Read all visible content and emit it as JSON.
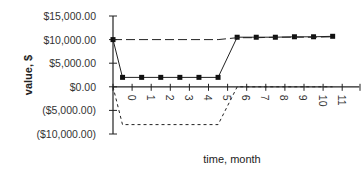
{
  "chart_data": {
    "type": "line",
    "title": "",
    "xlabel": "time, month",
    "ylabel": "value, $",
    "ylim": [
      -10000,
      15000
    ],
    "y_ticks": [
      "$15,000.00",
      "$10,000.00",
      "$5,000.00",
      "$0.00",
      "($5,000.00)",
      "($10,000.00)"
    ],
    "y_tick_values": [
      15000,
      10000,
      5000,
      0,
      -5000,
      -10000
    ],
    "x_tick_labels": [
      "0",
      "1",
      "2",
      "3",
      "4",
      "5",
      "6",
      "7",
      "8",
      "9",
      "10",
      "11"
    ],
    "grid": false,
    "legend": null,
    "series": [
      {
        "name": "solid-with-markers",
        "style": "solid",
        "markers": true,
        "x": [
          0,
          0.5,
          1.5,
          2.5,
          3.5,
          4.5,
          5.5,
          6.5,
          7.5,
          8.5,
          9.5,
          10.5,
          11.5
        ],
        "values": [
          10000,
          2000,
          2000,
          2000,
          2000,
          2000,
          2000,
          10500,
          10500,
          10500,
          10600,
          10600,
          10700
        ]
      },
      {
        "name": "long-dashed",
        "style": "dashed",
        "markers": false,
        "x": [
          0,
          5.5,
          6.5,
          7.5,
          8.5,
          9.5,
          10.5,
          11.5
        ],
        "values": [
          10000,
          10000,
          10400,
          10400,
          10500,
          10500,
          10500,
          10600
        ]
      },
      {
        "name": "dotted",
        "style": "dotted",
        "markers": false,
        "x": [
          0,
          0.5,
          5.5,
          6.5,
          7.5,
          8.5,
          9.5,
          10.5,
          11.5
        ],
        "values": [
          0,
          -8000,
          -8000,
          0,
          0,
          0,
          0,
          0,
          0
        ]
      }
    ]
  }
}
